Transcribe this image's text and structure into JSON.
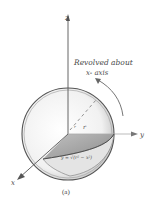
{
  "figure": {
    "caption": "(a)",
    "annotation_line1": "Revolved about",
    "annotation_line2": "x- axis",
    "curve_label": "y = √(r² − x²)",
    "radius_label": "r",
    "axes": {
      "x": "x",
      "y": "y",
      "z": "z"
    },
    "colors": {
      "ink": "#4a4a4a",
      "shade": "#9a9a9a",
      "background": "#ffffff"
    }
  }
}
